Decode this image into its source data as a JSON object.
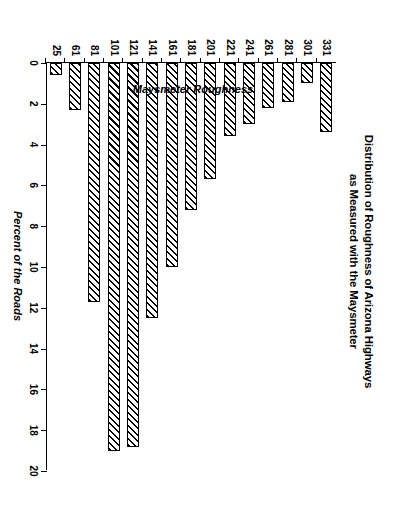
{
  "figure": {
    "title_line1": "Distribution of Roughness of Arizona Highways",
    "title_line2": "as Measured with the Maysmeter",
    "orientation_note": "chart printed sideways on a portrait page"
  },
  "chart_data": {
    "type": "bar",
    "orientation": "horizontal",
    "title": "Distribution of Roughness of Arizona Highways as Measured with the Maysmeter",
    "xlabel": "Percent of the Roads",
    "ylabel": "Maysmeter Roughness",
    "categories": [
      "25",
      "61",
      "81",
      "101",
      "121",
      "141",
      "161",
      "181",
      "201",
      "221",
      "241",
      "261",
      "281",
      "301",
      "331"
    ],
    "values": [
      0.6,
      2.3,
      11.7,
      19.0,
      18.8,
      12.5,
      10.0,
      7.2,
      5.7,
      3.6,
      3.0,
      2.2,
      1.9,
      1.0,
      3.4
    ],
    "value_axis_label": "Percent of the Roads",
    "category_axis_label": "Maysmeter Roughness",
    "xlim": [
      0,
      20
    ],
    "value_ticks": [
      "0",
      "2",
      "4",
      "6",
      "8",
      "10",
      "12",
      "14",
      "16",
      "18",
      "20"
    ],
    "value_tick_values": [
      0,
      2,
      4,
      6,
      8,
      10,
      12,
      14,
      16,
      18,
      20
    ],
    "grid": false,
    "legend": null,
    "bar_fill": "diagonal-hatch",
    "bar_outline_color": "#000000",
    "bar_fill_color": "#ffffff",
    "background_color": "#ffffff"
  }
}
